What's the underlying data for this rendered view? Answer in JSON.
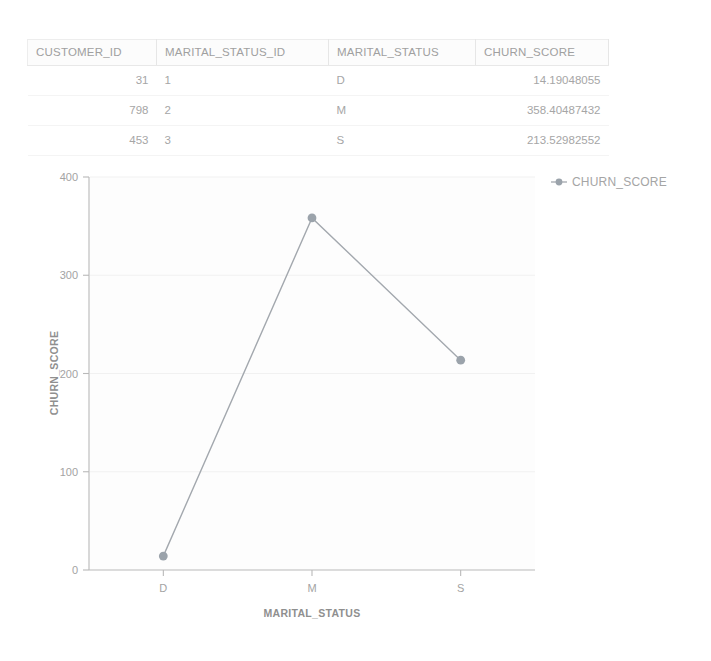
{
  "table": {
    "columns": [
      {
        "key": "customer_id",
        "label": "CUSTOMER_ID",
        "align": "right"
      },
      {
        "key": "marital_status_id",
        "label": "MARITAL_STATUS_ID",
        "align": "left"
      },
      {
        "key": "marital_status",
        "label": "MARITAL_STATUS",
        "align": "left"
      },
      {
        "key": "churn_score",
        "label": "CHURN_SCORE",
        "align": "right"
      }
    ],
    "rows": [
      {
        "customer_id": "31",
        "marital_status_id": "1",
        "marital_status": "D",
        "churn_score": "14.19048055"
      },
      {
        "customer_id": "798",
        "marital_status_id": "2",
        "marital_status": "M",
        "churn_score": "358.40487432"
      },
      {
        "customer_id": "453",
        "marital_status_id": "3",
        "marital_status": "S",
        "churn_score": "213.52982552"
      }
    ]
  },
  "legend": {
    "entries": [
      {
        "label": "CHURN_SCORE",
        "color": "#9ba3ab"
      }
    ]
  },
  "chart_data": {
    "type": "line",
    "title": "",
    "xlabel": "MARITAL_STATUS",
    "ylabel": "CHURN_SCORE",
    "categories": [
      "D",
      "M",
      "S"
    ],
    "series": [
      {
        "name": "CHURN_SCORE",
        "color": "#9ba3ab",
        "values": [
          14.19048055,
          358.40487432,
          213.52982552
        ]
      }
    ],
    "ylim": [
      0,
      400
    ],
    "yticks": [
      0,
      100,
      200,
      300,
      400
    ],
    "ytick_labels": [
      "0",
      "100",
      "200",
      "300",
      "400"
    ],
    "xtick_labels": [
      "D",
      "M",
      "S"
    ],
    "grid": true,
    "legend_position": "right",
    "marker": "circle"
  }
}
